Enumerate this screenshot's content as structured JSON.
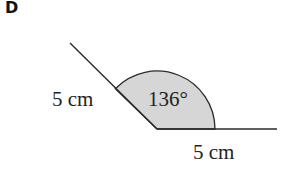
{
  "panel": {
    "label": "D"
  },
  "diagram": {
    "type": "angle-with-two-sides",
    "angle_label": "136°",
    "angle_degrees": 136,
    "side_left_label": "5 cm",
    "side_bottom_label": "5 cm",
    "colors": {
      "line": "#2a2a2a",
      "sector_fill": "#d6d6d6",
      "text": "#222222"
    }
  }
}
